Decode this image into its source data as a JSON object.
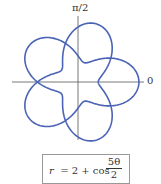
{
  "diagram": {
    "type": "polar-curve",
    "equation": {
      "lhs": "r",
      "mid": "= 2 + cos",
      "num": "5θ",
      "den": "2"
    },
    "axis_labels": {
      "top": "π/2",
      "right": "0"
    },
    "curve": {
      "a": 2,
      "b": 1,
      "k_num": 5,
      "k_den": 2,
      "theta_max_pi": 4,
      "color": "#4a63b5"
    },
    "axis_color": "#555555"
  }
}
